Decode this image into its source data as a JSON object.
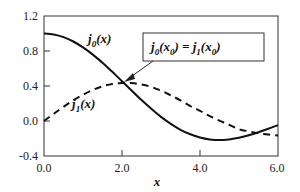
{
  "chart_data": {
    "type": "line",
    "title": "",
    "xlabel": "x",
    "ylabel": "",
    "xlim": [
      0.0,
      6.0
    ],
    "ylim": [
      -0.4,
      1.2
    ],
    "grid": false,
    "legend": "none (inline labels)",
    "xticks": [
      "0.0",
      "2.0",
      "4.0",
      "6.0"
    ],
    "yticks": [
      "-0.4",
      "0.0",
      "0.4",
      "0.8",
      "1.2"
    ],
    "x": [
      0,
      0.25,
      0.5,
      0.75,
      1,
      1.25,
      1.5,
      1.75,
      2,
      2.25,
      2.5,
      2.75,
      3,
      3.25,
      3.5,
      3.75,
      4,
      4.25,
      4.5,
      4.75,
      5,
      5.25,
      5.5,
      5.75,
      6
    ],
    "series": [
      {
        "name": "j0(x)",
        "style": "solid",
        "label_main": "j",
        "label_sub": "0",
        "label_arg": "(x)",
        "values": [
          1.0,
          0.99,
          0.959,
          0.909,
          0.841,
          0.759,
          0.665,
          0.562,
          0.455,
          0.345,
          0.239,
          0.139,
          0.047,
          -0.033,
          -0.1,
          -0.152,
          -0.189,
          -0.21,
          -0.217,
          -0.21,
          -0.192,
          -0.164,
          -0.128,
          -0.088,
          -0.047
        ]
      },
      {
        "name": "j1(x)",
        "style": "dashed",
        "label_main": "j",
        "label_sub": "1",
        "label_arg": "(x)",
        "values": [
          0.0,
          0.083,
          0.162,
          0.237,
          0.301,
          0.354,
          0.396,
          0.424,
          0.435,
          0.433,
          0.417,
          0.389,
          0.346,
          0.294,
          0.235,
          0.171,
          0.116,
          0.056,
          0.004,
          -0.043,
          -0.095,
          -0.118,
          -0.14,
          -0.154,
          -0.167
        ]
      }
    ],
    "annotations": [
      {
        "text": "j0(x0) = j1(x0)",
        "parts": {
          "lhs": "j",
          "lhs_sub": "0",
          "lhs_arg": "(x",
          "lhs_arg_sub": "0",
          "lhs_close": ")",
          "eq": " = ",
          "rhs": "j",
          "rhs_sub": "1",
          "rhs_arg": "(x",
          "rhs_arg_sub": "0",
          "rhs_close": ")"
        },
        "boxed": true,
        "arrow_to": {
          "x": 2.08,
          "y": 0.45
        }
      }
    ]
  }
}
